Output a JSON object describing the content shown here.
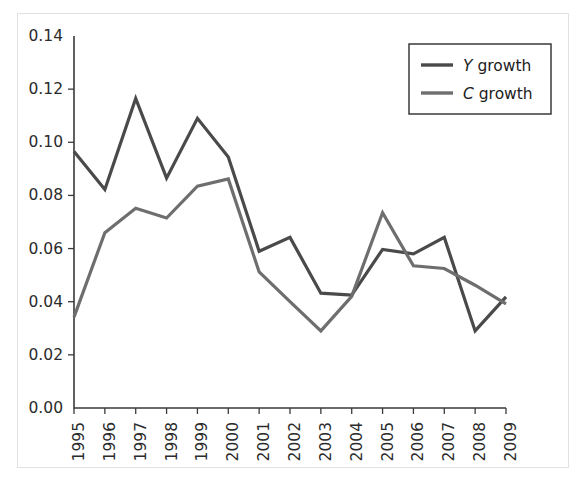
{
  "figure": {
    "background_color": "#ffffff",
    "frame_color": "#e2e2e2",
    "axis_color": "#3a3a3a"
  },
  "legend": {
    "position": "top-right",
    "entries": [
      {
        "symbol": "Y",
        "label": " growth",
        "full_label": "Y growth",
        "color": "#4a4a4a"
      },
      {
        "symbol": "C",
        "label": " growth",
        "full_label": "C growth",
        "color": "#6e6e6e"
      }
    ]
  },
  "chart_data": {
    "type": "line",
    "title": "",
    "xlabel": "",
    "ylabel": "",
    "grid": false,
    "legend_position": "top-right",
    "categories": [
      "1995",
      "1996",
      "1997",
      "1998",
      "1999",
      "2000",
      "2001",
      "2002",
      "2003",
      "2004",
      "2005",
      "2006",
      "2007",
      "2008",
      "2009"
    ],
    "x": [
      1995,
      1996,
      1997,
      1998,
      1999,
      2000,
      2001,
      2002,
      2003,
      2004,
      2005,
      2006,
      2007,
      2008,
      2009
    ],
    "xlim": [
      1995,
      2009
    ],
    "ylim": [
      0.0,
      0.14
    ],
    "ytick_labels": [
      "0.00",
      "0.02",
      "0.04",
      "0.06",
      "0.08",
      "0.10",
      "0.12",
      "0.14"
    ],
    "yticks": [
      0.0,
      0.02,
      0.04,
      0.06,
      0.08,
      0.1,
      0.12,
      0.14
    ],
    "xtick_labels": [
      "1995",
      "1996",
      "1997",
      "1998",
      "1999",
      "2000",
      "2001",
      "2002",
      "2003",
      "2004",
      "2005",
      "2006",
      "2007",
      "2008",
      "2009"
    ],
    "series": [
      {
        "name": "Y growth",
        "color": "#4a4a4a",
        "values": [
          0.0965,
          0.0822,
          0.1165,
          0.0865,
          0.109,
          0.0945,
          0.059,
          0.0642,
          0.0432,
          0.0425,
          0.0597,
          0.058,
          0.0642,
          0.029,
          0.0418
        ]
      },
      {
        "name": "C growth",
        "color": "#6e6e6e",
        "values": [
          0.0342,
          0.066,
          0.0752,
          0.0715,
          0.0835,
          0.0862,
          0.0512,
          0.04,
          0.029,
          0.042,
          0.0735,
          0.0535,
          0.0525,
          0.0462,
          0.0392
        ]
      }
    ]
  }
}
